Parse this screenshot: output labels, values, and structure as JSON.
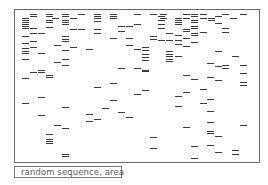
{
  "figure": {
    "caption": "random sequence, area"
  },
  "chart_data": {
    "type": "scatter",
    "title": "",
    "caption": "random sequence, area",
    "mark": "short horizontal dash",
    "frame": {
      "x": 14,
      "y": 9,
      "width": 246,
      "height": 154
    },
    "dashes": [
      [
        30,
        14,
        7
      ],
      [
        46,
        14,
        7
      ],
      [
        62,
        14,
        7
      ],
      [
        78,
        14,
        7
      ],
      [
        94,
        14,
        7
      ],
      [
        110,
        14,
        7
      ],
      [
        134,
        14,
        7
      ],
      [
        150,
        14,
        7
      ],
      [
        160,
        14,
        7
      ],
      [
        183,
        14,
        7
      ],
      [
        191,
        14,
        7
      ],
      [
        200,
        14,
        7
      ],
      [
        222,
        14,
        7
      ],
      [
        240,
        14,
        7
      ],
      [
        30,
        16,
        7
      ],
      [
        46,
        16,
        7
      ],
      [
        62,
        16,
        7
      ],
      [
        94,
        16,
        7
      ],
      [
        110,
        16,
        7
      ],
      [
        158,
        16,
        7
      ],
      [
        191,
        16,
        7
      ],
      [
        215,
        16,
        7
      ],
      [
        22,
        18,
        7
      ],
      [
        52,
        18,
        7
      ],
      [
        70,
        18,
        7
      ],
      [
        94,
        18,
        7
      ],
      [
        110,
        18,
        7
      ],
      [
        160,
        18,
        7
      ],
      [
        175,
        18,
        7
      ],
      [
        183,
        18,
        7
      ],
      [
        200,
        18,
        7
      ],
      [
        208,
        18,
        7
      ],
      [
        230,
        18,
        7
      ],
      [
        22,
        20,
        7
      ],
      [
        46,
        20,
        7
      ],
      [
        62,
        20,
        7
      ],
      [
        94,
        21,
        7
      ],
      [
        158,
        20,
        7
      ],
      [
        175,
        20,
        7
      ],
      [
        191,
        20,
        7
      ],
      [
        208,
        20,
        7
      ],
      [
        22,
        22,
        7
      ],
      [
        46,
        22,
        7
      ],
      [
        62,
        22,
        7
      ],
      [
        175,
        22,
        7
      ],
      [
        191,
        22,
        7
      ],
      [
        22,
        24,
        7
      ],
      [
        62,
        24,
        7
      ],
      [
        118,
        26,
        7
      ],
      [
        126,
        26,
        7
      ],
      [
        134,
        24,
        7
      ],
      [
        158,
        24,
        7
      ],
      [
        175,
        24,
        7
      ],
      [
        215,
        23,
        7
      ],
      [
        22,
        26,
        7
      ],
      [
        30,
        28,
        7
      ],
      [
        46,
        27,
        7
      ],
      [
        70,
        29,
        7
      ],
      [
        78,
        29,
        7
      ],
      [
        94,
        29,
        7
      ],
      [
        158,
        28,
        7
      ],
      [
        183,
        29,
        7
      ],
      [
        191,
        26,
        7
      ],
      [
        222,
        28,
        7
      ],
      [
        22,
        28,
        7
      ],
      [
        183,
        31,
        7
      ],
      [
        191,
        28,
        7
      ],
      [
        222,
        32,
        7
      ],
      [
        30,
        33,
        7
      ],
      [
        38,
        33,
        7
      ],
      [
        94,
        33,
        7
      ],
      [
        118,
        31,
        7
      ],
      [
        166,
        33,
        7
      ],
      [
        191,
        33,
        7
      ],
      [
        200,
        32,
        7
      ],
      [
        22,
        36,
        7
      ],
      [
        62,
        36,
        7
      ],
      [
        110,
        38,
        7
      ],
      [
        126,
        38,
        7
      ],
      [
        150,
        36,
        7
      ],
      [
        175,
        35,
        7
      ],
      [
        191,
        35,
        7
      ],
      [
        62,
        39,
        7
      ],
      [
        150,
        39,
        7
      ],
      [
        158,
        40,
        7
      ],
      [
        166,
        40,
        7
      ],
      [
        175,
        40,
        7
      ],
      [
        183,
        38,
        7
      ],
      [
        22,
        43,
        7
      ],
      [
        30,
        41,
        7
      ],
      [
        62,
        41,
        7
      ],
      [
        54,
        45,
        7
      ],
      [
        126,
        45,
        7
      ],
      [
        175,
        44,
        7
      ],
      [
        191,
        42,
        7
      ],
      [
        22,
        48,
        7
      ],
      [
        30,
        47,
        7
      ],
      [
        70,
        47,
        7
      ],
      [
        86,
        49,
        7
      ],
      [
        134,
        49,
        7
      ],
      [
        142,
        47,
        7
      ],
      [
        166,
        51,
        7
      ],
      [
        183,
        46,
        7
      ],
      [
        22,
        51,
        7
      ],
      [
        62,
        50,
        7
      ],
      [
        142,
        50,
        7
      ],
      [
        166,
        54,
        7
      ],
      [
        175,
        56,
        7
      ],
      [
        215,
        51,
        7
      ],
      [
        22,
        53,
        7
      ],
      [
        38,
        53,
        7
      ],
      [
        142,
        54,
        7
      ],
      [
        166,
        56,
        7
      ],
      [
        22,
        59,
        7
      ],
      [
        62,
        59,
        7
      ],
      [
        142,
        57,
        7
      ],
      [
        166,
        59,
        7
      ],
      [
        175,
        56,
        7
      ],
      [
        54,
        62,
        7
      ],
      [
        62,
        65,
        7
      ],
      [
        142,
        60,
        7
      ],
      [
        166,
        61,
        7
      ],
      [
        207,
        63,
        7
      ],
      [
        232,
        56,
        7
      ],
      [
        38,
        70,
        7
      ],
      [
        30,
        72,
        7
      ],
      [
        118,
        68,
        7
      ],
      [
        134,
        68,
        7
      ],
      [
        142,
        70,
        7
      ],
      [
        215,
        66,
        7
      ],
      [
        222,
        65,
        7
      ],
      [
        240,
        65,
        7
      ],
      [
        38,
        72,
        7
      ],
      [
        46,
        75,
        7
      ],
      [
        142,
        71,
        7
      ],
      [
        222,
        68,
        7
      ],
      [
        240,
        73,
        7
      ],
      [
        46,
        77,
        7
      ],
      [
        22,
        78,
        7
      ],
      [
        183,
        75,
        7
      ],
      [
        191,
        79,
        7
      ],
      [
        207,
        77,
        7
      ],
      [
        215,
        80,
        7
      ],
      [
        240,
        82,
        7
      ],
      [
        110,
        83,
        7
      ],
      [
        94,
        87,
        7
      ],
      [
        240,
        85,
        7
      ],
      [
        142,
        90,
        7
      ],
      [
        134,
        94,
        7
      ],
      [
        183,
        92,
        7
      ],
      [
        200,
        89,
        7
      ],
      [
        38,
        97,
        7
      ],
      [
        175,
        96,
        7
      ],
      [
        207,
        99,
        7
      ],
      [
        110,
        100,
        7
      ],
      [
        22,
        103,
        7
      ],
      [
        62,
        107,
        7
      ],
      [
        200,
        103,
        7
      ],
      [
        207,
        111,
        7
      ],
      [
        102,
        108,
        7
      ],
      [
        175,
        106,
        7
      ],
      [
        118,
        112,
        7
      ],
      [
        86,
        114,
        7
      ],
      [
        38,
        115,
        7
      ],
      [
        126,
        117,
        7
      ],
      [
        94,
        119,
        7
      ],
      [
        86,
        121,
        7
      ],
      [
        207,
        122,
        7
      ],
      [
        54,
        125,
        7
      ],
      [
        62,
        128,
        7
      ],
      [
        183,
        127,
        7
      ],
      [
        207,
        131,
        7
      ],
      [
        240,
        125,
        7
      ],
      [
        46,
        134,
        7
      ],
      [
        207,
        133,
        7
      ],
      [
        215,
        136,
        7
      ],
      [
        46,
        139,
        7
      ],
      [
        46,
        141,
        7
      ],
      [
        46,
        143,
        7
      ],
      [
        150,
        137,
        7
      ],
      [
        150,
        148,
        7
      ],
      [
        191,
        146,
        7
      ],
      [
        207,
        145,
        7
      ],
      [
        215,
        152,
        7
      ],
      [
        232,
        150,
        7
      ],
      [
        232,
        154,
        7
      ],
      [
        62,
        154,
        7
      ],
      [
        62,
        156,
        7
      ],
      [
        191,
        158,
        7
      ]
    ]
  }
}
